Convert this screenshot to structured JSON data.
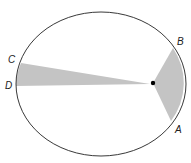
{
  "diagram": {
    "colors": {
      "orbit": "#222222",
      "sector_fill": "#c4c4c4",
      "focus": "#000000"
    },
    "points": {
      "A": {
        "label": "A"
      },
      "B": {
        "label": "B"
      },
      "C": {
        "label": "C"
      },
      "D": {
        "label": "D"
      }
    }
  }
}
